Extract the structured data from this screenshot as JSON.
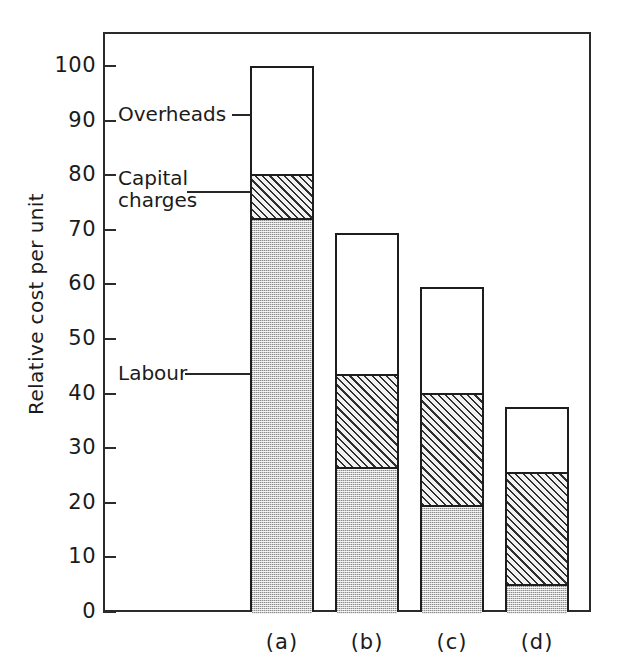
{
  "chart_data": {
    "type": "bar",
    "subtype": "stacked-bar",
    "title": "",
    "xlabel": "",
    "ylabel": "Relative cost per unit",
    "categories": [
      "(a)",
      "(b)",
      "(c)",
      "(d)"
    ],
    "ylim": [
      0,
      100
    ],
    "ytick_values": [
      0,
      10,
      20,
      30,
      40,
      50,
      60,
      70,
      80,
      90,
      100
    ],
    "ytick_labels": [
      "0",
      "10",
      "20",
      "30",
      "40",
      "50",
      "60",
      "70",
      "80",
      "90",
      "100"
    ],
    "grid": false,
    "legend_position": "inline-annotations",
    "series": [
      {
        "name": "Labour",
        "fill": "gray-stipple",
        "values": [
          72.5,
          27.0,
          20.0,
          5.5
        ]
      },
      {
        "name": "Capital charges",
        "fill": "diagonal-hatch",
        "values": [
          8.0,
          17.0,
          20.5,
          20.5
        ]
      },
      {
        "name": "Overheads",
        "fill": "white",
        "values": [
          19.5,
          25.5,
          19.0,
          11.5
        ]
      }
    ],
    "cumulative_tops": {
      "labour": [
        72.5,
        27.0,
        20.0,
        5.5
      ],
      "capital_charges": [
        80.5,
        44.0,
        40.5,
        26.0
      ],
      "total": [
        100.0,
        69.5,
        59.5,
        37.5
      ]
    },
    "annotations": [
      {
        "label": "Overheads",
        "value": 91.0
      },
      {
        "label": "Capital\ncharges",
        "value": 77.0
      },
      {
        "label": "Labour",
        "value": 43.5
      }
    ]
  },
  "axis": {
    "y_title": "Relative cost per unit",
    "ticks": [
      {
        "label": "100"
      },
      {
        "label": "90"
      },
      {
        "label": "80"
      },
      {
        "label": "70"
      },
      {
        "label": "60"
      },
      {
        "label": "50"
      },
      {
        "label": "40"
      },
      {
        "label": "30"
      },
      {
        "label": "20"
      },
      {
        "label": "10"
      },
      {
        "label": "0"
      }
    ]
  },
  "categories": [
    {
      "label": "(a)"
    },
    {
      "label": "(b)"
    },
    {
      "label": "(c)"
    },
    {
      "label": "(d)"
    }
  ],
  "annotations": [
    {
      "label": "Overheads"
    },
    {
      "label_line1": "Capital",
      "label_line2": "charges"
    },
    {
      "label": "Labour"
    }
  ],
  "colors": {
    "axis": "#2b2b2b",
    "bar_outline": "#1d1d1d",
    "labour_fill": "#c9c9c9",
    "capital_fill": "#e9e9e9",
    "overheads_fill": "#ffffff",
    "text": "#1b1b1b"
  }
}
